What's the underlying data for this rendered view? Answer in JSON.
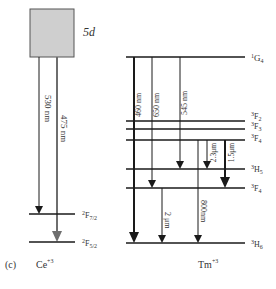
{
  "panel_label": "(c)",
  "colors": {
    "line": "#1a1a1a",
    "box_fill": "#cfcfcf",
    "box_stroke": "#555555",
    "gray_arrow": "#6e6e6e"
  },
  "ce": {
    "ion": "Ce",
    "charge": "+3",
    "band_label": "5d",
    "levels": [
      {
        "term": "2F7/2",
        "sup": "2",
        "letter": "F",
        "sub": "7/2"
      },
      {
        "term": "2F5/2",
        "sup": "2",
        "letter": "F",
        "sub": "5/2"
      }
    ],
    "transitions": [
      {
        "label": "530 nm",
        "from": "5d",
        "to": "2F7/2"
      },
      {
        "label": "475 nm",
        "from": "5d",
        "to": "2F5/2"
      }
    ]
  },
  "tm": {
    "ion": "Tm",
    "charge": "+3",
    "levels": [
      {
        "term": "1G4",
        "sup": "1",
        "letter": "G",
        "sub": "4"
      },
      {
        "term": "3F2",
        "sup": "3",
        "letter": "F",
        "sub": "2"
      },
      {
        "term": "3F3",
        "sup": "3",
        "letter": "F",
        "sub": "3"
      },
      {
        "term": "3F4",
        "sup": "3",
        "letter": "F",
        "sub": "4"
      },
      {
        "term": "3H5",
        "sup": "3",
        "letter": "H",
        "sub": "5"
      },
      {
        "term": "3F4",
        "sup": "3",
        "letter": "F",
        "sub": "4"
      },
      {
        "term": "3H6",
        "sup": "3",
        "letter": "H",
        "sub": "6"
      }
    ],
    "transitions": [
      {
        "label": "460 nm",
        "from": "1G4",
        "to": "3H6"
      },
      {
        "label": "650 nm",
        "from": "1G4",
        "to": "3F4"
      },
      {
        "label": "545 nm",
        "from": "1G4",
        "to": "3H5"
      },
      {
        "label": "800nm",
        "from": "3F4",
        "to": "3H6"
      },
      {
        "label": "2.3μm",
        "from": "3F4",
        "to": "3H5"
      },
      {
        "label": "1.5μm",
        "from": "3F4",
        "to": "3H5"
      },
      {
        "label": "2 μm",
        "from": "3F4",
        "to": "3H6"
      }
    ]
  }
}
